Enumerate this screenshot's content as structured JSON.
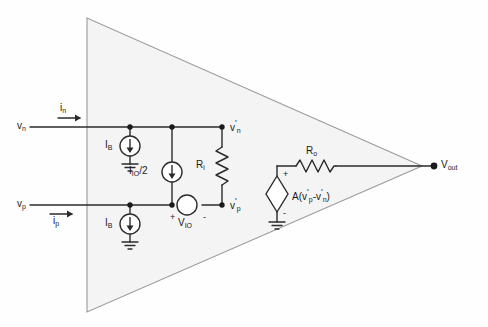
{
  "diagram": {
    "colors": {
      "background": "#fefefe",
      "triangle_fill": "#f4f4f4",
      "triangle_stroke": "#9a9a9a",
      "wire": "#2b2b2b",
      "text": "#1a1a1a"
    }
  },
  "terminals": {
    "inverting_input": "v",
    "inverting_input_sub": "n",
    "noninverting_input": "v",
    "noninverting_input_sub": "p",
    "output": "V",
    "output_sub": "out"
  },
  "currents": {
    "input_current_n": "i",
    "input_current_n_sub": "n",
    "input_current_p": "i",
    "input_current_p_sub": "p"
  },
  "components": {
    "bias_current_top": {
      "label": "I",
      "sub": "B"
    },
    "bias_current_bottom": {
      "label": "I",
      "sub": "B"
    },
    "offset_current": {
      "label": "I",
      "sub": "IO",
      "suffix": "/2"
    },
    "input_resistance": {
      "label": "R",
      "sub": "i"
    },
    "output_resistance": {
      "label": "R",
      "sub": "o"
    },
    "offset_voltage": {
      "label": "V",
      "sub": "IO"
    },
    "dependent_source": {
      "prefix": "A(v",
      "sub1": "p",
      "minus": "-v",
      "sub2": "n",
      "suffix": ")"
    }
  },
  "nodes": {
    "internal_n": {
      "label": "v",
      "sub": "n"
    },
    "internal_p": {
      "label": "v",
      "sub": "p"
    }
  },
  "polarity": {
    "plus": "+",
    "minus": "-"
  }
}
